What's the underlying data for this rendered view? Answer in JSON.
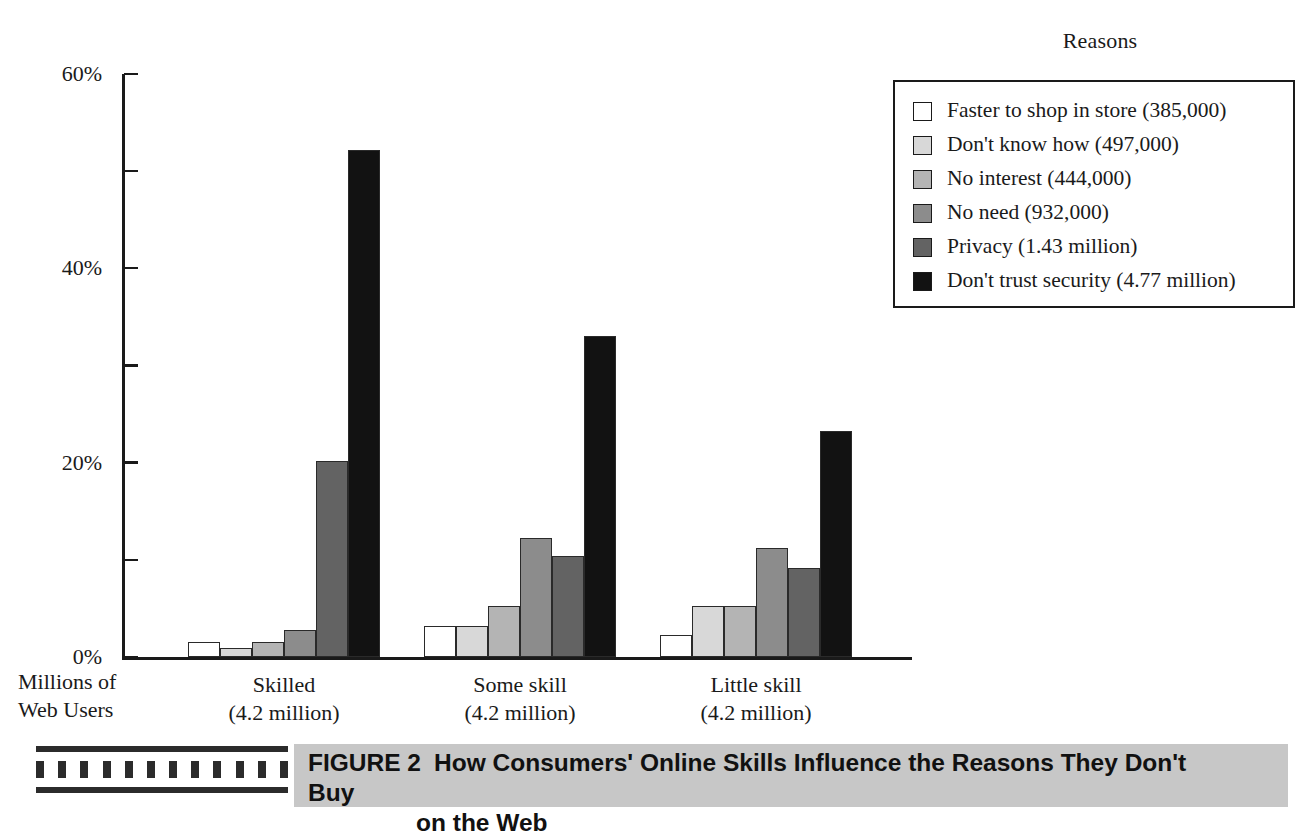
{
  "figure": {
    "number_label": "FIGURE 2",
    "caption_line1": "How Consumers' Online Skills Influence the Reasons They Don't Buy",
    "caption_line2": "on the Web"
  },
  "legend": {
    "title": "Reasons",
    "items": [
      {
        "label": "Faster to shop in store (385,000)",
        "color": "#ffffff"
      },
      {
        "label": "Don't know how (497,000)",
        "color": "#d8d8d8"
      },
      {
        "label": "No interest (444,000)",
        "color": "#b4b4b4"
      },
      {
        "label": "No need (932,000)",
        "color": "#8c8c8c"
      },
      {
        "label": "Privacy (1.43 million)",
        "color": "#636363"
      },
      {
        "label": "Don't trust security (4.77 million)",
        "color": "#121212"
      }
    ]
  },
  "axis": {
    "y_caption_line1": "Millions of",
    "y_caption_line2": "Web Users",
    "y_major_ticks": [
      "0%",
      "20%",
      "40%",
      "60%"
    ],
    "y_minor_ticks": [
      "10%",
      "30%",
      "50%"
    ]
  },
  "chart_data": {
    "type": "bar",
    "title": "How Consumers' Online Skills Influence the Reasons They Don't Buy on the Web",
    "xlabel": "Millions of Web Users",
    "ylabel": "",
    "ylim": [
      0,
      60
    ],
    "yunit": "%",
    "ytick_values": [
      0,
      10,
      20,
      30,
      40,
      50,
      60
    ],
    "ytick_labels": [
      "0%",
      "",
      "20%",
      "",
      "40%",
      "",
      "60%"
    ],
    "grid": false,
    "legend_position": "top-right",
    "categories": [
      "Skilled",
      "Some skill",
      "Little skill"
    ],
    "category_sublabels": [
      "(4.2 million)",
      "(4.2 million)",
      "(4.2 million)"
    ],
    "series": [
      {
        "name": "Faster to shop in store (385,000)",
        "color": "#ffffff",
        "values": [
          1.5,
          3.2,
          2.3
        ]
      },
      {
        "name": "Don't know how (497,000)",
        "color": "#d8d8d8",
        "values": [
          0.9,
          3.2,
          5.2
        ]
      },
      {
        "name": "No interest (444,000)",
        "color": "#b4b4b4",
        "values": [
          1.5,
          5.3,
          5.3
        ]
      },
      {
        "name": "No need (932,000)",
        "color": "#8c8c8c",
        "values": [
          2.8,
          12.3,
          11.2
        ]
      },
      {
        "name": "Privacy (1.43 million)",
        "color": "#636363",
        "values": [
          20.2,
          10.4,
          9.2
        ]
      },
      {
        "name": "Don't trust security (4.77 million)",
        "color": "#121212",
        "values": [
          52.2,
          33.0,
          23.3
        ]
      }
    ]
  }
}
